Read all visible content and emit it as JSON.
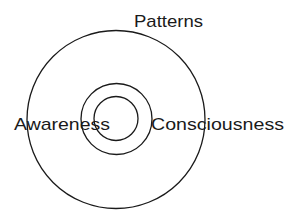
{
  "diagram": {
    "type": "concentric-circles",
    "labels": {
      "top": "Patterns",
      "left": "Awareness",
      "right": "Consciousness"
    },
    "circles": [
      {
        "name": "outer",
        "cx": 116,
        "cy": 119.5,
        "r": 89
      },
      {
        "name": "middle",
        "cx": 116.5,
        "cy": 119,
        "r": 35.5
      },
      {
        "name": "inner",
        "cx": 116,
        "cy": 118.5,
        "r": 22
      }
    ],
    "colors": {
      "stroke": "#1a1a1a",
      "background": "#ffffff"
    }
  }
}
